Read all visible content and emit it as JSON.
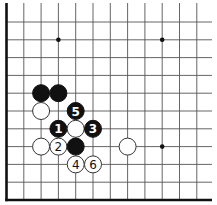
{
  "diagram": {
    "type": "go-board-fragment",
    "board_section": "lower-left corner",
    "edges_shown": [
      "left",
      "bottom"
    ],
    "columns": 12,
    "rows": 11,
    "star_points": [
      {
        "col": 3,
        "row": 1
      },
      {
        "col": 9,
        "row": 1
      },
      {
        "col": 9,
        "row": 7
      }
    ],
    "stones": [
      {
        "color": "black",
        "col": 2,
        "row": 4,
        "label": ""
      },
      {
        "color": "black",
        "col": 3,
        "row": 4,
        "label": ""
      },
      {
        "color": "white",
        "col": 2,
        "row": 5,
        "label": ""
      },
      {
        "color": "black",
        "col": 4,
        "row": 5,
        "label": "5"
      },
      {
        "color": "black",
        "col": 3,
        "row": 6,
        "label": "1"
      },
      {
        "color": "white",
        "col": 4,
        "row": 6,
        "label": ""
      },
      {
        "color": "black",
        "col": 5,
        "row": 6,
        "label": "3"
      },
      {
        "color": "white",
        "col": 2,
        "row": 7,
        "label": ""
      },
      {
        "color": "white",
        "col": 3,
        "row": 7,
        "label": "2"
      },
      {
        "color": "black",
        "col": 4,
        "row": 7,
        "label": ""
      },
      {
        "color": "white",
        "col": 7,
        "row": 7,
        "label": ""
      },
      {
        "color": "white",
        "col": 4,
        "row": 8,
        "label": "4"
      },
      {
        "color": "white",
        "col": 5,
        "row": 8,
        "label": "6"
      }
    ],
    "colors": {
      "black_stone": "#111111",
      "white_stone": "#ffffff",
      "grid": "#555555",
      "background": "#ffffff"
    }
  }
}
